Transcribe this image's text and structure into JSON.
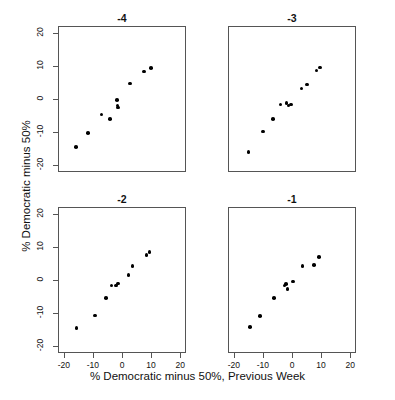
{
  "chart_data": {
    "type": "scatter",
    "title": "",
    "xlabel": "% Democratic minus 50%, Previous Week",
    "ylabel": "% Democratic minus 50%",
    "xlim": [
      -22,
      22
    ],
    "ylim": [
      -22,
      22
    ],
    "xticks": [
      -20,
      -10,
      0,
      10,
      20
    ],
    "yticks": [
      -20,
      -10,
      0,
      10,
      20
    ],
    "xtick_labels": [
      "-20",
      "-10",
      "0",
      "10",
      "20"
    ],
    "ytick_labels": [
      "-20",
      "-10",
      "0",
      "10",
      "20"
    ],
    "grid": false,
    "legend": "none",
    "layout": "2x2 panel trellis",
    "panels": [
      {
        "title": "-4",
        "position": "top-left",
        "points": [
          {
            "x": -15.8,
            "y": -14.4
          },
          {
            "x": -11.6,
            "y": -10.3
          },
          {
            "x": -7.0,
            "y": -4.7
          },
          {
            "x": -4.2,
            "y": -6.1
          },
          {
            "x": -1.8,
            "y": -0.3
          },
          {
            "x": -1.5,
            "y": -2.0
          },
          {
            "x": -1.3,
            "y": -2.6
          },
          {
            "x": 2.8,
            "y": 4.7
          },
          {
            "x": 7.6,
            "y": 8.3
          },
          {
            "x": 10.0,
            "y": 9.4
          }
        ]
      },
      {
        "title": "-3",
        "position": "top-right",
        "points": [
          {
            "x": -15.0,
            "y": -15.9
          },
          {
            "x": -10.0,
            "y": -9.8
          },
          {
            "x": -6.6,
            "y": -6.1
          },
          {
            "x": -4.0,
            "y": -1.6
          },
          {
            "x": -1.9,
            "y": -1.2
          },
          {
            "x": -1.2,
            "y": -1.9
          },
          {
            "x": -0.4,
            "y": -1.6
          },
          {
            "x": 3.3,
            "y": 3.2
          },
          {
            "x": 5.2,
            "y": 4.4
          },
          {
            "x": 8.4,
            "y": 8.6
          },
          {
            "x": 9.6,
            "y": 9.5
          }
        ]
      },
      {
        "title": "-2",
        "position": "bottom-left",
        "points": [
          {
            "x": -15.6,
            "y": -14.5
          },
          {
            "x": -9.2,
            "y": -10.7
          },
          {
            "x": -5.6,
            "y": -5.5
          },
          {
            "x": -3.6,
            "y": -1.6
          },
          {
            "x": -2.1,
            "y": -1.7
          },
          {
            "x": -1.4,
            "y": -1.0
          },
          {
            "x": 2.3,
            "y": 1.5
          },
          {
            "x": 3.6,
            "y": 4.3
          },
          {
            "x": 8.4,
            "y": 7.6
          },
          {
            "x": 9.4,
            "y": 8.4
          }
        ]
      },
      {
        "title": "-1",
        "position": "bottom-right",
        "points": [
          {
            "x": -14.4,
            "y": -14.2
          },
          {
            "x": -11.0,
            "y": -10.9
          },
          {
            "x": -6.2,
            "y": -5.4
          },
          {
            "x": -2.6,
            "y": -1.7
          },
          {
            "x": -2.0,
            "y": -1.2
          },
          {
            "x": -1.6,
            "y": -2.8
          },
          {
            "x": 0.4,
            "y": -0.4
          },
          {
            "x": 3.6,
            "y": 4.3
          },
          {
            "x": 7.6,
            "y": 4.6
          },
          {
            "x": 9.2,
            "y": 6.9
          }
        ]
      }
    ]
  }
}
